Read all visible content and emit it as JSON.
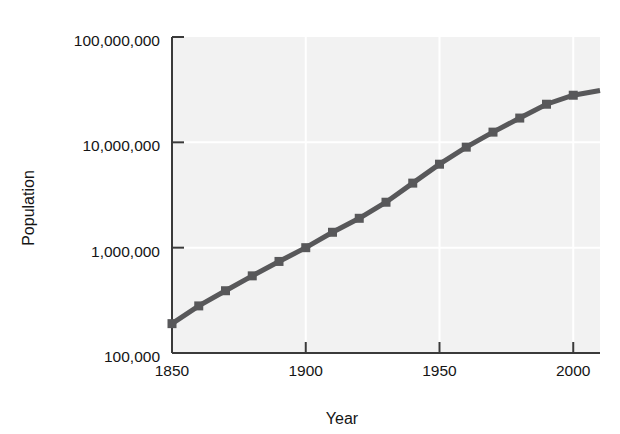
{
  "chart_data": {
    "type": "line",
    "title": "",
    "xlabel": "Year",
    "ylabel": "Population",
    "yscale": "log",
    "xlim": [
      1850,
      2010
    ],
    "ylim": [
      100000,
      100000000
    ],
    "grid": true,
    "legend": null,
    "marker": "square",
    "series": [
      {
        "name": "Population",
        "x": [
          1850,
          1860,
          1870,
          1880,
          1890,
          1900,
          1910,
          1920,
          1930,
          1940,
          1950,
          1960,
          1970,
          1980,
          1990,
          2000
        ],
        "y": [
          190000,
          280000,
          390000,
          540000,
          740000,
          1000000,
          1400000,
          1900000,
          2700000,
          4100000,
          6200000,
          9000000,
          12500000,
          17000000,
          23000000,
          28000000
        ]
      }
    ],
    "line_extends_to": {
      "x": 2010,
      "y": 31000000
    },
    "x_ticks": [
      1850,
      1900,
      1950,
      2000
    ],
    "x_tick_labels": [
      "1850",
      "1900",
      "1950",
      "2000"
    ],
    "y_ticks": [
      100000,
      1000000,
      10000000,
      100000000
    ],
    "y_tick_labels": [
      "100,000",
      "1,000,000",
      "10,000,000",
      "100,000,000"
    ],
    "colors": {
      "line": "#58585a",
      "marker": "#58585a",
      "plot_background": "#f2f2f2",
      "axis": "#3a3a3a",
      "gridline": "#ffffff",
      "text": "#151515",
      "page_background": "#ffffff"
    }
  },
  "axes": {
    "y_label": "Population",
    "x_label": "Year",
    "y_tick_labels": [
      "100,000,000",
      "10,000,000",
      "1,000,000",
      "100,000"
    ],
    "x_tick_labels": [
      "1850",
      "1900",
      "1950",
      "2000"
    ]
  }
}
